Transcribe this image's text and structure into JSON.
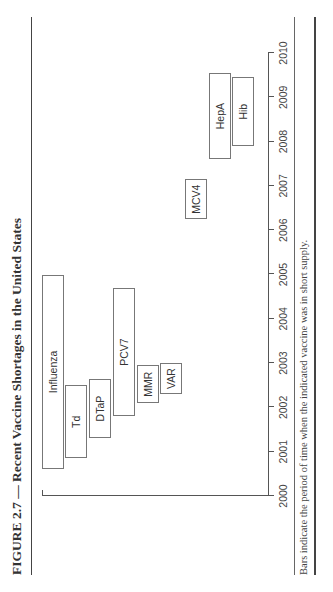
{
  "figure": {
    "title": "FIGURE 2.7 — Recent Vaccine Shortages in the United States",
    "note": "Bars indicate the period of time when the indicated vaccine was in short supply.",
    "orientation": "rotated 90° counterclockwise"
  },
  "chart_data": {
    "type": "gantt",
    "title": "Recent Vaccine Shortages in the United States",
    "xlabel": "",
    "ylabel": "",
    "xlim": [
      2000,
      2010
    ],
    "x_ticks": [
      "2000",
      "2001",
      "2002",
      "2003",
      "2004",
      "2005",
      "2006",
      "2007",
      "2008",
      "2009",
      "2010"
    ],
    "grid": false,
    "legend": null,
    "series": [
      {
        "name": "Influenza",
        "start": 2000.6,
        "end": 2005.0,
        "row": 0
      },
      {
        "name": "Td",
        "start": 2000.85,
        "end": 2002.5,
        "row": 1
      },
      {
        "name": "DTaP",
        "start": 2001.3,
        "end": 2002.65,
        "row": 2
      },
      {
        "name": "PCV7",
        "start": 2001.8,
        "end": 2004.7,
        "row": 3
      },
      {
        "name": "MMR",
        "start": 2002.1,
        "end": 2002.95,
        "row": 4
      },
      {
        "name": "VAR",
        "start": 2002.3,
        "end": 2003.0,
        "row": 5
      },
      {
        "name": "MCV4",
        "start": 2006.25,
        "end": 2007.15,
        "row": 6
      },
      {
        "name": "HepA",
        "start": 2007.6,
        "end": 2009.55,
        "row": 7
      },
      {
        "name": "Hib",
        "start": 2007.9,
        "end": 2009.45,
        "row": 8
      }
    ],
    "annotation": "Bars indicate the period of time when the indicated vaccine was in short supply."
  }
}
